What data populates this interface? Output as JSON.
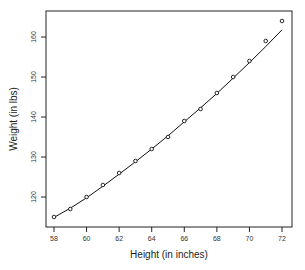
{
  "chart_data": {
    "type": "scatter",
    "title": "",
    "xlabel": "Height (in inches)",
    "ylabel": "Weight (in lbs)",
    "x": [
      58,
      59,
      60,
      61,
      62,
      63,
      64,
      65,
      66,
      67,
      68,
      69,
      70,
      71,
      72
    ],
    "series": [
      {
        "name": "observed",
        "style": "open-circles",
        "values": [
          115,
          117,
          120,
          123,
          126,
          129,
          132,
          135,
          139,
          142,
          146,
          150,
          154,
          159,
          164
        ]
      },
      {
        "name": "fitted curve",
        "style": "line",
        "values": [
          114.9,
          117.2,
          119.8,
          122.7,
          125.7,
          128.8,
          132.0,
          135.3,
          138.8,
          142.3,
          145.9,
          149.7,
          153.6,
          157.6,
          161.8
        ]
      }
    ],
    "xticks": [
      58,
      60,
      62,
      64,
      66,
      68,
      70,
      72
    ],
    "yticks": [
      120,
      130,
      140,
      150,
      160
    ],
    "xlim": [
      57.5,
      72.6
    ],
    "ylim": [
      113,
      166.5
    ],
    "grid": false,
    "legend": null
  }
}
